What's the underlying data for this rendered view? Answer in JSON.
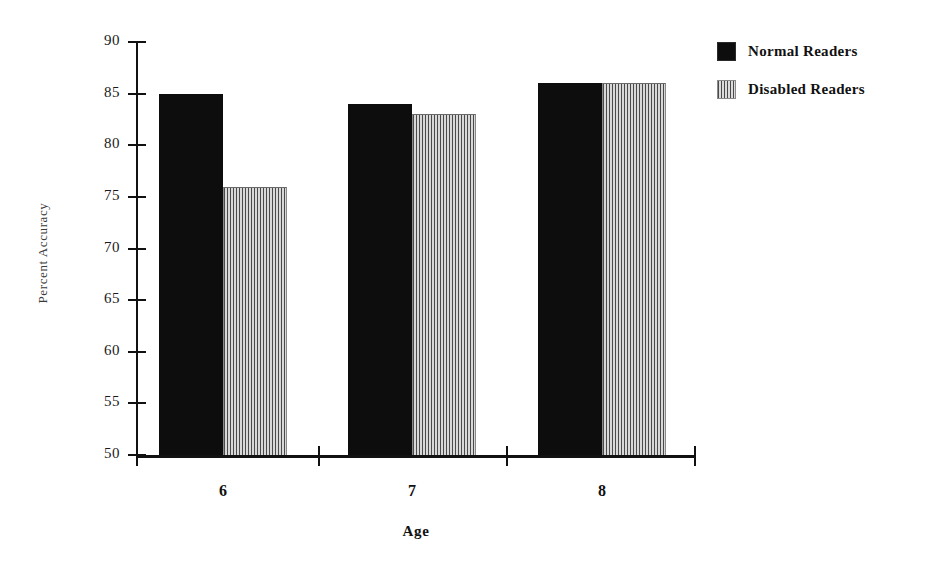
{
  "chart_data": {
    "type": "bar",
    "title": "",
    "xlabel": "Age",
    "ylabel": "Percent Accuracy",
    "categories": [
      "6",
      "7",
      "8"
    ],
    "ylim": [
      50,
      90
    ],
    "ytick_labels": [
      "90",
      "85",
      "80",
      "75",
      "70",
      "65",
      "60",
      "55",
      "50"
    ],
    "ytick_values": [
      90,
      85,
      80,
      75,
      70,
      65,
      60,
      55,
      50
    ],
    "grid": false,
    "legend_position": "right",
    "series": [
      {
        "name": "Normal  Readers",
        "fill": "solid-black",
        "color": "#0d0d0d",
        "values": [
          85,
          84,
          86
        ]
      },
      {
        "name": "Disabled Readers",
        "fill": "vertical-stripes",
        "color": "#d8d8d8",
        "values": [
          76,
          83,
          86
        ]
      }
    ]
  },
  "axes": {
    "y_title": "Percent Accuracy",
    "x_title": "Age"
  },
  "legend": {
    "items": [
      {
        "label": "Normal  Readers",
        "swatch": "solid-black-swatch"
      },
      {
        "label": "Disabled Readers",
        "swatch": "striped-swatch"
      }
    ]
  }
}
